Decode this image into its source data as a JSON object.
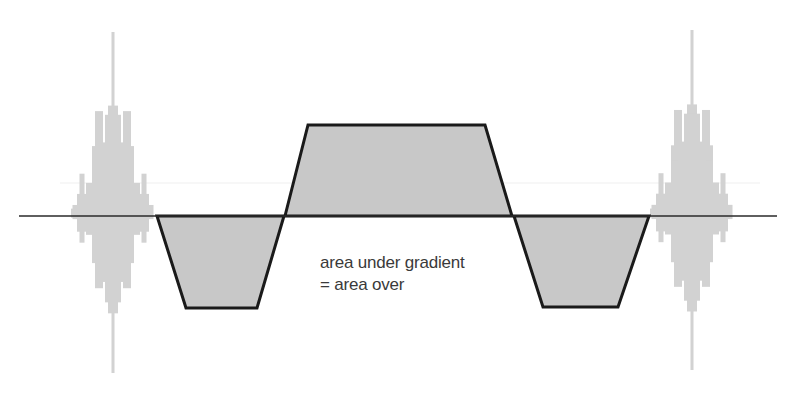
{
  "diagram": {
    "annotation": {
      "line1": "area under gradient",
      "line2": "= area over"
    },
    "colors": {
      "background": "#ffffff",
      "baseline": "#2a2a2a",
      "gradient_outline": "#1a1a1a",
      "gradient_fill": "#c8c8c8",
      "rf_pulse": "#d2d2d2",
      "text": "#3a3a3a"
    },
    "baseline": {
      "y": 216,
      "x_start": 19,
      "x_end": 777
    },
    "rf_pulses": [
      {
        "name": "left-rf-pulse",
        "center_x": 113,
        "top_y": 32,
        "bottom_y": 373
      },
      {
        "name": "right-rf-pulse",
        "center_x": 692,
        "top_y": 30,
        "bottom_y": 370
      }
    ],
    "gradient_lobes": [
      {
        "name": "negative-lobe-left",
        "polarity": "negative",
        "points": [
          [
            157,
            216
          ],
          [
            186,
            308
          ],
          [
            257,
            308
          ],
          [
            284,
            216
          ]
        ]
      },
      {
        "name": "positive-lobe-center",
        "polarity": "positive",
        "points": [
          [
            285,
            216
          ],
          [
            308,
            125
          ],
          [
            485,
            125
          ],
          [
            512,
            216
          ]
        ]
      },
      {
        "name": "negative-lobe-right",
        "polarity": "negative",
        "points": [
          [
            514,
            216
          ],
          [
            543,
            307
          ],
          [
            618,
            307
          ],
          [
            649,
            216
          ]
        ]
      }
    ]
  }
}
